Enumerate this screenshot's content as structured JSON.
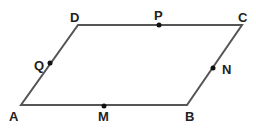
{
  "diagram": {
    "shape": "parallelogram",
    "stroke_color": "#555555",
    "point_color": "#111111",
    "vertices": [
      {
        "name": "A",
        "label": "A"
      },
      {
        "name": "B",
        "label": "B"
      },
      {
        "name": "C",
        "label": "C"
      },
      {
        "name": "D",
        "label": "D"
      }
    ],
    "points": [
      {
        "name": "M",
        "label": "M",
        "on": "AB"
      },
      {
        "name": "N",
        "label": "N",
        "on": "BC"
      },
      {
        "name": "P",
        "label": "P",
        "on": "CD"
      },
      {
        "name": "Q",
        "label": "Q",
        "on": "DA"
      }
    ]
  }
}
